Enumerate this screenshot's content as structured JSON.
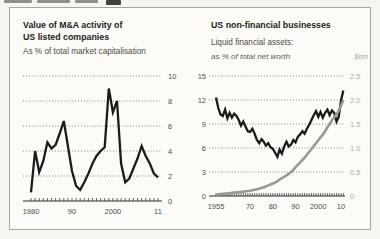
{
  "chart_data": [
    {
      "type": "line",
      "title": "Value of M&A activity of US listed companies",
      "title_line1": "Value of M&A activity of",
      "title_line2": "US listed companies",
      "subtitle": "As % of total market capitalisation",
      "x_start": 1980,
      "x_end": 2011,
      "xtick_years": [
        1980,
        1990,
        2000,
        2011
      ],
      "xtick_labels": [
        "1980",
        "90",
        "2000",
        "11"
      ],
      "ylim": [
        0,
        10
      ],
      "ytick_values": [
        0,
        2,
        4,
        6,
        8,
        10
      ],
      "ytick_labels_right": [
        "0",
        "2",
        "4",
        "6",
        "8",
        "10"
      ],
      "grid": "dotted",
      "legend_position": "none",
      "series": [
        {
          "name": "M&A value as % of total market capitalisation",
          "axis": "left",
          "color": "#1c1b19",
          "values": [
            0.7,
            4.0,
            2.3,
            3.2,
            4.7,
            4.2,
            4.5,
            5.4,
            6.4,
            4.4,
            2.4,
            1.2,
            0.9,
            1.5,
            2.2,
            3.0,
            3.6,
            4.0,
            4.3,
            9.0,
            7.1,
            8.0,
            3.0,
            1.5,
            1.8,
            2.6,
            3.4,
            4.4,
            3.6,
            3.0,
            2.2,
            1.9
          ]
        }
      ]
    },
    {
      "type": "line",
      "title": "US non-financial businesses",
      "subtitle": "Liquid financial assets:",
      "left_axis_label": "as % of total net worth",
      "right_axis_label": "$trn",
      "x_start": 1955,
      "x_end": 2011,
      "xtick_years": [
        1955,
        1970,
        1980,
        1990,
        2000,
        2010
      ],
      "xtick_labels": [
        "1955",
        "70",
        "80",
        "90",
        "2000",
        "10"
      ],
      "left_ylim": [
        0,
        15
      ],
      "right_ylim": [
        0,
        2.5
      ],
      "ytick_values": [
        0,
        3,
        6,
        9,
        12,
        15
      ],
      "ytick_labels_left": [
        "0",
        "3",
        "6",
        "9",
        "12",
        "15"
      ],
      "ytick_labels_right": [
        "0",
        "0.5",
        "1.0",
        "1.5",
        "2.0",
        "2.5"
      ],
      "grid": "dotted",
      "legend_position": "none",
      "series": [
        {
          "name": "Liquid assets as % of total net worth",
          "axis": "left",
          "color": "#1c1b19",
          "values": [
            12.3,
            11.0,
            10.2,
            10.0,
            10.8,
            9.7,
            10.4,
            9.8,
            10.3,
            10.0,
            9.5,
            8.8,
            9.3,
            8.7,
            8.1,
            8.0,
            8.4,
            7.8,
            7.0,
            6.6,
            7.1,
            6.8,
            6.3,
            6.6,
            6.1,
            5.9,
            5.4,
            4.9,
            5.8,
            5.3,
            6.2,
            6.8,
            6.2,
            6.4,
            7.0,
            6.7,
            7.4,
            7.7,
            8.1,
            7.8,
            8.4,
            8.9,
            9.5,
            10.1,
            10.6,
            9.9,
            10.5,
            9.8,
            10.4,
            10.8,
            10.1,
            10.7,
            10.4,
            9.3,
            9.9,
            11.9,
            13.2
          ]
        },
        {
          "name": "Liquid assets $trn",
          "axis": "right",
          "color": "#9a9894",
          "values": [
            0.03,
            0.035,
            0.04,
            0.045,
            0.05,
            0.055,
            0.06,
            0.065,
            0.07,
            0.075,
            0.08,
            0.085,
            0.09,
            0.1,
            0.105,
            0.11,
            0.12,
            0.13,
            0.14,
            0.15,
            0.17,
            0.18,
            0.2,
            0.22,
            0.24,
            0.26,
            0.28,
            0.31,
            0.34,
            0.37,
            0.4,
            0.43,
            0.46,
            0.5,
            0.54,
            0.6,
            0.65,
            0.7,
            0.75,
            0.8,
            0.86,
            0.92,
            0.98,
            1.04,
            1.1,
            1.16,
            1.22,
            1.28,
            1.35,
            1.43,
            1.5,
            1.57,
            1.64,
            1.7,
            1.78,
            1.88,
            2.0
          ]
        }
      ]
    }
  ],
  "colors": {
    "line_black": "#1c1b19",
    "line_gray": "#9a9894",
    "axis_dark": "#2e2d2a",
    "grid_dot": "#7d7a74",
    "tick_label_dark": "#4f4c47",
    "tick_label_gray": "#b0ada6",
    "panel_border": "#a8a6a1"
  }
}
